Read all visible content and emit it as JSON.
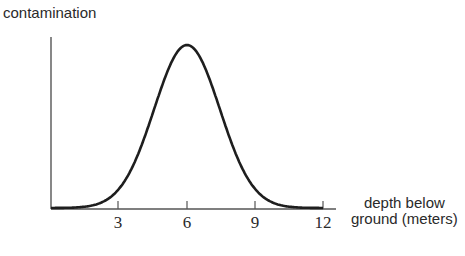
{
  "chart_data": {
    "type": "line",
    "title": "",
    "xlabel": "depth below ground (meters)",
    "ylabel": "contamination",
    "xlim": [
      0,
      12.3
    ],
    "ylim": [
      0,
      1
    ],
    "grid": false,
    "xticks": [
      3,
      6,
      9,
      12
    ],
    "series": [
      {
        "name": "contamination",
        "shape": "normal (bell) curve",
        "peak_x": 6,
        "x": [
          0,
          1,
          2,
          3,
          4,
          5,
          6,
          7,
          8,
          9,
          10,
          11,
          12
        ],
        "values": [
          0.0,
          0.01,
          0.04,
          0.14,
          0.42,
          0.8,
          1.0,
          0.8,
          0.42,
          0.14,
          0.04,
          0.01,
          0.0
        ]
      }
    ]
  },
  "labels": {
    "ylabel": "contamination",
    "xlabel_line1": "depth below",
    "xlabel_line2": "ground (meters)",
    "ticks": [
      "3",
      "6",
      "9",
      "12"
    ]
  }
}
